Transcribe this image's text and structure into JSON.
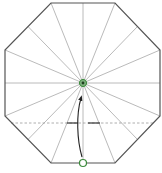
{
  "diagram": {
    "type": "origami-fold-diagram",
    "shape": "octagon",
    "colors": {
      "outline": "#555555",
      "crease": "#a8a8a8",
      "valley_fold": "#999999",
      "arrow": "#222222",
      "marker": "#3a8a3a",
      "marker_center": "#1f3f1f"
    },
    "octagon_vertices": [
      [
        51,
        3
      ],
      [
        115,
        3
      ],
      [
        160,
        50
      ],
      [
        160,
        116
      ],
      [
        115,
        163
      ],
      [
        51,
        163
      ],
      [
        5,
        116
      ],
      [
        5,
        50
      ]
    ],
    "center": [
      83,
      83
    ],
    "crease_count": 16,
    "fold_line_y": 123,
    "markers": [
      {
        "name": "center-point",
        "x": 83,
        "y": 83,
        "style": "filled"
      },
      {
        "name": "bottom-edge-point",
        "x": 83,
        "y": 163,
        "style": "hollow"
      }
    ],
    "arrow": {
      "from": [
        82,
        158
      ],
      "to": [
        81,
        96
      ],
      "direction": "up"
    }
  }
}
